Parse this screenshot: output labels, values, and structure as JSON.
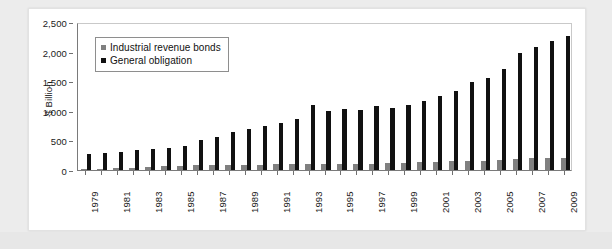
{
  "chart_data": {
    "type": "bar",
    "title": "",
    "subtitle": "",
    "xlabel": "",
    "ylabel": "$ Billion",
    "ylim": [
      0,
      2500
    ],
    "y_ticks": [
      0,
      500,
      1000,
      1500,
      2000,
      2500
    ],
    "y_tick_labels": [
      "0",
      "500",
      "1,000",
      "1,500",
      "2,000",
      "2,500"
    ],
    "grid": false,
    "legend_position": "upper-left",
    "categories": [
      "1979",
      "1980",
      "1981",
      "1982",
      "1983",
      "1984",
      "1985",
      "1986",
      "1987",
      "1988",
      "1989",
      "1990",
      "1991",
      "1992",
      "1993",
      "1994",
      "1995",
      "1996",
      "1997",
      "1998",
      "1999",
      "2000",
      "2001",
      "2002",
      "2003",
      "2004",
      "2005",
      "2006",
      "2007",
      "2008",
      "2009"
    ],
    "x_tick_labels_shown": [
      "1979",
      "1981",
      "1983",
      "1985",
      "1987",
      "1989",
      "1991",
      "1993",
      "1995",
      "1997",
      "1999",
      "2001",
      "2003",
      "2005",
      "2007",
      "2009"
    ],
    "series": [
      {
        "name": "Industrial revenue bonds",
        "color": "#808080",
        "values": [
          20,
          25,
          30,
          40,
          50,
          60,
          75,
          85,
          80,
          85,
          85,
          90,
          95,
          100,
          105,
          95,
          100,
          105,
          110,
          120,
          125,
          130,
          140,
          150,
          155,
          160,
          170,
          180,
          195,
          200,
          210
        ]
      },
      {
        "name": "General obligation",
        "color": "#111111",
        "values": [
          270,
          285,
          300,
          330,
          355,
          380,
          405,
          500,
          560,
          640,
          700,
          740,
          800,
          870,
          1100,
          1000,
          1030,
          1020,
          1080,
          1040,
          1100,
          1160,
          1250,
          1330,
          1480,
          1560,
          1710,
          1980,
          2080,
          2180,
          2270
        ]
      }
    ],
    "legend": [
      {
        "label": "Industrial revenue bonds",
        "color": "#808080"
      },
      {
        "label": "General obligation",
        "color": "#111111"
      }
    ]
  },
  "caption": ""
}
